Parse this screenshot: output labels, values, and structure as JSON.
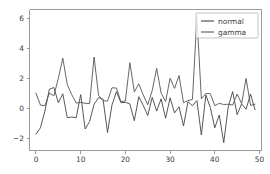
{
  "chart_data": {
    "type": "line",
    "title": "",
    "xlabel": "",
    "ylabel": "",
    "xlim": [
      -1.45,
      50.45
    ],
    "ylim": [
      -2.82,
      6.62
    ],
    "xticks": [
      0,
      10,
      20,
      30,
      40,
      50
    ],
    "yticks": [
      -2,
      0,
      2,
      4,
      6
    ],
    "xtick_labels": [
      "0",
      "10",
      "20",
      "30",
      "40",
      "50"
    ],
    "ytick_labels": [
      "−2",
      "0",
      "2",
      "4",
      "6"
    ],
    "grid": false,
    "legend_position": "upper right",
    "x": [
      0,
      1,
      2,
      3,
      4,
      5,
      6,
      7,
      8,
      9,
      10,
      11,
      12,
      13,
      14,
      15,
      16,
      17,
      18,
      19,
      20,
      21,
      22,
      23,
      24,
      25,
      26,
      27,
      28,
      29,
      30,
      31,
      32,
      33,
      34,
      35,
      36,
      37,
      38,
      39,
      40,
      41,
      42,
      43,
      44,
      45,
      46,
      47,
      48,
      49
    ],
    "series": [
      {
        "name": "normal",
        "color": "#444444",
        "values": [
          -1.72,
          -1.3,
          -0.18,
          1.28,
          1.4,
          0.38,
          0.98,
          -0.62,
          -0.58,
          -0.62,
          0.92,
          -1.38,
          -0.88,
          0.28,
          0.72,
          0.62,
          -1.62,
          0.22,
          1.12,
          0.38,
          0.4,
          0.3,
          -0.82,
          0.78,
          0.2,
          -0.48,
          0.74,
          -0.18,
          0.64,
          -0.66,
          0.7,
          -0.3,
          0.1,
          -1.18,
          0.44,
          0.18,
          0.52,
          -1.78,
          0.9,
          0.06,
          -1.3,
          -0.44,
          -2.3,
          0.08,
          1.12,
          -0.42,
          0.3,
          -0.06,
          0.96,
          -0.1
        ]
      },
      {
        "name": "gamma",
        "color": "#555555",
        "values": [
          1.02,
          0.22,
          0.18,
          1.02,
          0.84,
          2.02,
          3.36,
          1.6,
          0.92,
          0.36,
          0.4,
          0.34,
          0.32,
          3.44,
          0.88,
          0.52,
          0.48,
          1.38,
          1.36,
          0.44,
          0.5,
          3.06,
          1.1,
          1.64,
          0.9,
          0.24,
          1.2,
          2.68,
          1.02,
          0.46,
          2.02,
          1.34,
          2.2,
          0.38,
          0.52,
          0.6,
          6.1,
          0.64,
          1.0,
          0.98,
          0.18,
          0.34,
          0.26,
          0.28,
          0.22,
          0.96,
          0.32,
          2.0,
          0.2,
          0.28
        ]
      }
    ]
  },
  "legend": {
    "entries": [
      {
        "label": "normal"
      },
      {
        "label": "gamma"
      }
    ]
  },
  "colors": {
    "background": "#ffffff",
    "spine": "#9a9a9a",
    "text": "#3c3c3c"
  }
}
